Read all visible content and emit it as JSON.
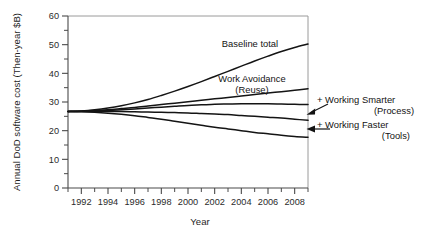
{
  "chart_data": {
    "type": "line",
    "title": "",
    "xlabel": "Year",
    "ylabel": "Annual DoD software cost (Then-year $B)",
    "xlim": [
      1991,
      2009
    ],
    "ylim": [
      0,
      60
    ],
    "yticks": [
      0,
      10,
      20,
      30,
      40,
      50,
      60
    ],
    "ytick_labels": [
      "0",
      "10",
      "20",
      "30",
      "40",
      "50",
      "60"
    ],
    "yminor_step": 5,
    "xticks": [
      1992,
      1994,
      1996,
      1998,
      2000,
      2002,
      2004,
      2006,
      2008
    ],
    "xtick_labels": [
      "1992",
      "1994",
      "1996",
      "1998",
      "2000",
      "2002",
      "2004",
      "2006",
      "2008"
    ],
    "xminor_step": 1,
    "grid": false,
    "legend": "inline-annotations",
    "x": [
      1991,
      1992,
      1993,
      1994,
      1995,
      1996,
      1997,
      1998,
      1999,
      2000,
      2001,
      2002,
      2003,
      2004,
      2005,
      2006,
      2007,
      2008,
      2009
    ],
    "series": [
      {
        "name": "Baseline total",
        "values": [
          26.7,
          26.9,
          27.3,
          27.9,
          28.7,
          29.7,
          30.9,
          32.3,
          33.8,
          35.4,
          37.1,
          38.9,
          40.7,
          42.5,
          44.3,
          46.0,
          47.6,
          49.0,
          50.2
        ]
      },
      {
        "name": "Work Avoidance (Reuse)",
        "values": [
          26.7,
          26.8,
          27.0,
          27.3,
          27.7,
          28.1,
          28.6,
          29.1,
          29.6,
          30.1,
          30.6,
          31.1,
          31.6,
          32.1,
          32.6,
          33.1,
          33.6,
          34.1,
          34.6
        ]
      },
      {
        "name": "+ Working Smarter (Process)",
        "values": [
          26.7,
          26.8,
          26.9,
          27.1,
          27.3,
          27.6,
          27.9,
          28.2,
          28.5,
          28.8,
          29.0,
          29.2,
          29.3,
          29.4,
          29.4,
          29.4,
          29.3,
          29.2,
          29.1
        ]
      },
      {
        "name": "+ Working Faster (Tools)",
        "values": [
          26.7,
          26.7,
          26.7,
          26.7,
          26.7,
          26.6,
          26.5,
          26.4,
          26.3,
          26.2,
          26.0,
          25.8,
          25.6,
          25.3,
          25.0,
          24.7,
          24.4,
          24.0,
          23.6
        ]
      },
      {
        "name": "lowest",
        "values": [
          26.7,
          26.6,
          26.4,
          26.1,
          25.7,
          25.2,
          24.6,
          24.0,
          23.3,
          22.6,
          21.9,
          21.2,
          20.6,
          20.0,
          19.4,
          18.9,
          18.4,
          18.0,
          17.7
        ]
      }
    ],
    "annotations": [
      {
        "id": "baseline-total",
        "text": "Baseline total",
        "line2": ""
      },
      {
        "id": "work-avoidance",
        "text": "Work Avoidance",
        "line2": "(Reuse)"
      },
      {
        "id": "working-smarter",
        "text": "+ Working Smarter",
        "line2": "(Process)"
      },
      {
        "id": "working-faster",
        "text": "+ Working Faster",
        "line2": "(Tools)"
      }
    ],
    "colors": {
      "line": "#141414",
      "axis": "#4a4a4a",
      "frame": "#9a9a9a",
      "text": "#1a1a1a",
      "background": "#ffffff"
    }
  }
}
